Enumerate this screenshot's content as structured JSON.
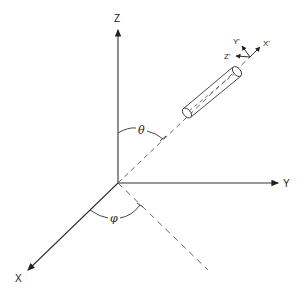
{
  "diagram": {
    "type": "3D coordinate system with rotated body frame",
    "axes": {
      "z": {
        "label": "Z"
      },
      "y": {
        "label": "Y"
      },
      "x": {
        "label": "X"
      }
    },
    "body_axes": {
      "x_prime": {
        "label": "X'"
      },
      "y_prime": {
        "label": "Y'"
      },
      "z_prime": {
        "label": "Z'"
      }
    },
    "angles": {
      "polar": {
        "label": "θ"
      },
      "azimuth": {
        "label": "φ"
      }
    },
    "colors": {
      "line": "#333333",
      "background": "#ffffff"
    }
  }
}
